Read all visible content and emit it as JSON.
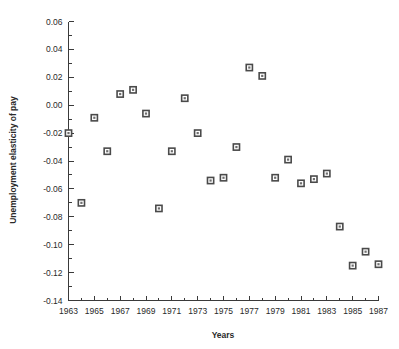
{
  "chart_data": {
    "type": "scatter",
    "title": "",
    "xlabel": "Years",
    "ylabel": "Unemployment elasticity of pay",
    "xlim": [
      1963,
      1987
    ],
    "ylim": [
      -0.14,
      0.06
    ],
    "grid": false,
    "legend": null,
    "x_major_ticks": [
      1963,
      1965,
      1967,
      1969,
      1971,
      1973,
      1975,
      1977,
      1979,
      1981,
      1983,
      1985,
      1987
    ],
    "x_tick_labels": [
      "1963",
      "1965",
      "1967",
      "1969",
      "1971",
      "1973",
      "1975",
      "1977",
      "1979",
      "1981",
      "1983",
      "1985",
      "1987"
    ],
    "x_minor_ticks": [
      1964,
      1966,
      1968,
      1970,
      1972,
      1974,
      1976,
      1978,
      1980,
      1982,
      1984,
      1986
    ],
    "y_major_ticks": [
      0.06,
      0.04,
      0.02,
      0.0,
      -0.02,
      -0.04,
      -0.06,
      -0.08,
      -0.1,
      -0.12,
      -0.14
    ],
    "y_tick_labels": [
      "0.06",
      "0.04",
      "0.02",
      "0.00",
      "-0.02",
      "-0.04",
      "-0.06",
      "-0.08",
      "-0.10",
      "-0.12",
      "-0.14"
    ],
    "y_minor_ticks": [
      0.05,
      0.03,
      0.01,
      -0.01,
      -0.03,
      -0.05,
      -0.07,
      -0.09,
      -0.11,
      -0.13
    ],
    "marker": "open-square",
    "marker_color": "#4a4a4a",
    "x": [
      1963,
      1964,
      1965,
      1966,
      1967,
      1968,
      1969,
      1970,
      1971,
      1972,
      1973,
      1974,
      1975,
      1976,
      1977,
      1978,
      1979,
      1980,
      1981,
      1982,
      1983,
      1984,
      1985,
      1986,
      1987
    ],
    "values": [
      -0.02,
      -0.07,
      -0.009,
      -0.033,
      0.008,
      0.011,
      -0.006,
      -0.074,
      -0.033,
      0.005,
      -0.02,
      -0.054,
      -0.052,
      -0.03,
      0.027,
      0.021,
      -0.052,
      -0.039,
      -0.056,
      -0.053,
      -0.049,
      -0.087,
      -0.115,
      -0.105,
      -0.114
    ],
    "points": [
      {
        "x": 1963,
        "y": -0.02
      },
      {
        "x": 1964,
        "y": -0.07
      },
      {
        "x": 1965,
        "y": -0.009
      },
      {
        "x": 1966,
        "y": -0.033
      },
      {
        "x": 1967,
        "y": 0.008
      },
      {
        "x": 1968,
        "y": 0.011
      },
      {
        "x": 1969,
        "y": -0.006
      },
      {
        "x": 1970,
        "y": -0.074
      },
      {
        "x": 1971,
        "y": -0.033
      },
      {
        "x": 1972,
        "y": 0.005
      },
      {
        "x": 1973,
        "y": -0.02
      },
      {
        "x": 1974,
        "y": -0.054
      },
      {
        "x": 1975,
        "y": -0.052
      },
      {
        "x": 1976,
        "y": -0.03
      },
      {
        "x": 1977,
        "y": 0.027
      },
      {
        "x": 1978,
        "y": 0.021
      },
      {
        "x": 1979,
        "y": -0.052
      },
      {
        "x": 1980,
        "y": -0.039
      },
      {
        "x": 1981,
        "y": -0.056
      },
      {
        "x": 1982,
        "y": -0.053
      },
      {
        "x": 1983,
        "y": -0.049
      },
      {
        "x": 1984,
        "y": -0.087
      },
      {
        "x": 1985,
        "y": -0.115
      },
      {
        "x": 1986,
        "y": -0.105
      },
      {
        "x": 1987,
        "y": -0.114
      }
    ]
  }
}
